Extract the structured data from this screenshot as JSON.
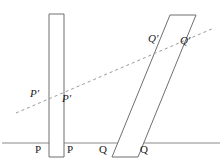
{
  "figure": {
    "canvas": {
      "width": 222,
      "height": 167,
      "background": "#ffffff"
    },
    "colors": {
      "stroke": "#6f6f6f",
      "ground_line": "#8a8a8a",
      "dashed_line": "#9a9a9a",
      "label_text": "#1a1a1a"
    },
    "ground_line": {
      "name": "ground-line",
      "x1": 2,
      "y1": 143,
      "x2": 220,
      "y2": 143
    },
    "dashed_line": {
      "name": "dashed-transversal",
      "x1": 16,
      "y1": 113,
      "x2": 214,
      "y2": 28,
      "dash": "3 3"
    },
    "rectangle": {
      "name": "vertical-rectangle",
      "points": "49,14 64,14 64,157 49,157"
    },
    "parallelogram": {
      "name": "slanted-parallelogram",
      "points": "170,15 196,15 138,157 112,157"
    },
    "labels": [
      {
        "id": "p-left",
        "text": "P",
        "x": 35,
        "y": 144
      },
      {
        "id": "p-right",
        "text": "P",
        "x": 67,
        "y": 144
      },
      {
        "id": "q-left",
        "text": "Q",
        "x": 99,
        "y": 144
      },
      {
        "id": "q-right",
        "text": "Q",
        "x": 140,
        "y": 144
      },
      {
        "id": "p-prime-left",
        "text": "P'",
        "x": 30,
        "y": 88
      },
      {
        "id": "p-prime-right",
        "text": "P'",
        "x": 62,
        "y": 93
      },
      {
        "id": "q-prime-left",
        "text": "Q'",
        "x": 148,
        "y": 33
      },
      {
        "id": "q-prime-right",
        "text": "Q'",
        "x": 180,
        "y": 35
      }
    ]
  }
}
